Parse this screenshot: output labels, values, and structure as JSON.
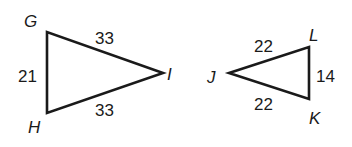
{
  "diagram": {
    "triangles": [
      {
        "name": "GHI",
        "vertices": {
          "G": {
            "label": "G",
            "x": 47,
            "y": 32
          },
          "H": {
            "label": "H",
            "x": 47,
            "y": 113
          },
          "I": {
            "label": "I",
            "x": 163,
            "y": 73
          }
        },
        "sides": {
          "GH": "21",
          "GI": "33",
          "HI": "33"
        }
      },
      {
        "name": "JKL",
        "vertices": {
          "J": {
            "label": "J",
            "x": 229,
            "y": 73
          },
          "L": {
            "label": "L",
            "x": 309,
            "y": 47
          },
          "K": {
            "label": "K",
            "x": 309,
            "y": 99
          }
        },
        "sides": {
          "JL": "22",
          "JK": "22",
          "LK": "14"
        }
      }
    ],
    "stroke_color": "#1a1a1a"
  }
}
